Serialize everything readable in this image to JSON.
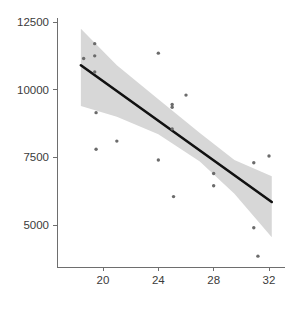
{
  "chart_data": {
    "type": "scatter",
    "title": "",
    "subtitle": "",
    "xlabel": "",
    "ylabel": "",
    "xlim": [
      18.2,
      32.7
    ],
    "ylim": [
      3450,
      12850
    ],
    "grid": false,
    "legend": null,
    "x_ticks": [
      20,
      24,
      28,
      32
    ],
    "x_tick_labels": [
      "20",
      "24",
      "28",
      "32"
    ],
    "y_ticks": [
      5000,
      7500,
      10000,
      12500
    ],
    "y_tick_labels": [
      "5000",
      "7500",
      "10000",
      "12500"
    ],
    "series": [
      {
        "name": "observations",
        "type": "scatter",
        "marker": "circle",
        "color": "#6b6b6b",
        "points": [
          {
            "x": 18.6,
            "y": 11150
          },
          {
            "x": 19.4,
            "y": 11700
          },
          {
            "x": 19.4,
            "y": 11250
          },
          {
            "x": 19.4,
            "y": 10650
          },
          {
            "x": 19.5,
            "y": 9150
          },
          {
            "x": 19.5,
            "y": 7800
          },
          {
            "x": 21.0,
            "y": 8100
          },
          {
            "x": 24.0,
            "y": 11350
          },
          {
            "x": 24.0,
            "y": 7400
          },
          {
            "x": 25.0,
            "y": 9450
          },
          {
            "x": 25.0,
            "y": 9350
          },
          {
            "x": 25.0,
            "y": 8550
          },
          {
            "x": 25.1,
            "y": 6050
          },
          {
            "x": 26.0,
            "y": 9800
          },
          {
            "x": 28.0,
            "y": 6900
          },
          {
            "x": 28.0,
            "y": 6450
          },
          {
            "x": 30.9,
            "y": 7300
          },
          {
            "x": 30.9,
            "y": 4900
          },
          {
            "x": 31.2,
            "y": 3850
          },
          {
            "x": 32.0,
            "y": 7550
          }
        ]
      },
      {
        "name": "linear-fit",
        "type": "line",
        "color": "#111111",
        "endpoints": [
          {
            "x": 18.4,
            "y": 10900
          },
          {
            "x": 32.2,
            "y": 5850
          }
        ]
      },
      {
        "name": "confidence-band",
        "type": "area",
        "color": "#d7d7d7",
        "upper": [
          {
            "x": 18.4,
            "y": 12250
          },
          {
            "x": 21.0,
            "y": 10900
          },
          {
            "x": 24.0,
            "y": 9650
          },
          {
            "x": 27.0,
            "y": 8400
          },
          {
            "x": 29.5,
            "y": 7400
          },
          {
            "x": 32.2,
            "y": 6800
          }
        ],
        "lower": [
          {
            "x": 18.4,
            "y": 9400
          },
          {
            "x": 21.0,
            "y": 9000
          },
          {
            "x": 24.0,
            "y": 8350
          },
          {
            "x": 27.0,
            "y": 7350
          },
          {
            "x": 29.5,
            "y": 6150
          },
          {
            "x": 32.2,
            "y": 4550
          }
        ]
      }
    ]
  },
  "axes": {
    "x_axis_name": "x-axis",
    "y_axis_name": "y-axis"
  }
}
